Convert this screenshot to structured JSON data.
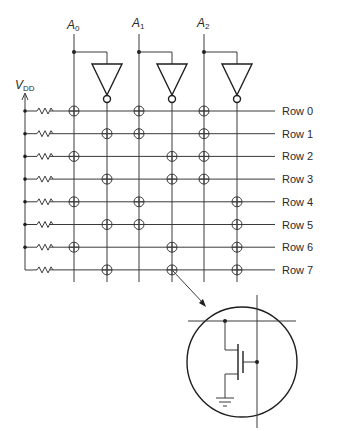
{
  "diagram": {
    "title": "",
    "supply_label": "V",
    "supply_subscript": "DD",
    "address_inputs": [
      {
        "name": "A",
        "subscript": "0"
      },
      {
        "name": "A",
        "subscript": "1"
      },
      {
        "name": "A",
        "subscript": "2"
      }
    ],
    "rows": [
      "Row 0",
      "Row 1",
      "Row 2",
      "Row 3",
      "Row 4",
      "Row 5",
      "Row 6",
      "Row 7"
    ],
    "columns": [
      "A0",
      "not A0",
      "A1",
      "not A1",
      "A2",
      "not A2"
    ],
    "transistor_sites": {
      "A0": [
        0,
        2,
        4,
        6
      ],
      "not A0": [
        1,
        3,
        5,
        7
      ],
      "A1": [
        0,
        1,
        4,
        5
      ],
      "not A1": [
        2,
        3,
        6,
        7
      ],
      "A2": [
        0,
        1,
        2,
        3
      ],
      "not A2": [
        4,
        5,
        6,
        7
      ]
    },
    "magnified_site": {
      "row": 7,
      "column": "not A1",
      "detail": "nMOS transistor to ground"
    }
  }
}
